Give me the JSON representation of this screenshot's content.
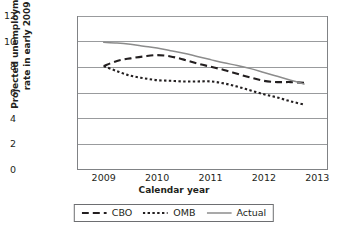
{
  "chart_data": {
    "type": "line",
    "title": "",
    "xlabel": "Calendar year",
    "ylabel": "Projected unemployment rate in early 2009",
    "ylabel_line1": "Projected unemployment",
    "ylabel_line2": "rate in early 2009",
    "xlim": [
      2008.5,
      2013.2
    ],
    "ylim": [
      0,
      12
    ],
    "yticks": [
      12,
      10,
      8,
      6,
      4,
      2,
      0
    ],
    "xticks": [
      2009,
      2010,
      2011,
      2012,
      2013
    ],
    "grid": "horizontal",
    "legend_position": "bottom-center",
    "series": [
      {
        "name": "CBO",
        "style": "dashed",
        "color": "#231f20",
        "x": [
          2009.0,
          2009.25,
          2009.5,
          2009.75,
          2010.0,
          2010.25,
          2010.5,
          2010.75,
          2011.0,
          2011.25,
          2011.5,
          2011.75,
          2012.0,
          2012.25,
          2012.5,
          2012.75
        ],
        "y": [
          8.1,
          8.5,
          8.7,
          8.85,
          8.95,
          8.85,
          8.6,
          8.3,
          8.05,
          7.8,
          7.5,
          7.2,
          6.95,
          6.85,
          6.85,
          6.8
        ]
      },
      {
        "name": "OMB",
        "style": "dotted",
        "color": "#231f20",
        "x": [
          2009.0,
          2009.25,
          2009.5,
          2009.75,
          2010.0,
          2010.25,
          2010.5,
          2010.75,
          2011.0,
          2011.25,
          2011.5,
          2011.75,
          2012.0,
          2012.25,
          2012.5,
          2012.75
        ],
        "y": [
          8.1,
          7.7,
          7.35,
          7.15,
          7.0,
          6.95,
          6.9,
          6.9,
          6.9,
          6.75,
          6.5,
          6.2,
          5.9,
          5.65,
          5.35,
          5.1
        ]
      },
      {
        "name": "Actual",
        "style": "solid",
        "color": "#8c8c8c",
        "x": [
          2009.0,
          2009.25,
          2009.5,
          2009.75,
          2010.0,
          2010.25,
          2010.5,
          2010.75,
          2011.0,
          2011.25,
          2011.5,
          2011.75,
          2012.0,
          2012.25,
          2012.5,
          2012.75
        ],
        "y": [
          9.95,
          9.9,
          9.8,
          9.65,
          9.5,
          9.3,
          9.1,
          8.85,
          8.6,
          8.35,
          8.15,
          7.9,
          7.6,
          7.3,
          7.0,
          6.7
        ]
      }
    ],
    "legend": [
      {
        "label": "CBO",
        "style": "dashed"
      },
      {
        "label": "OMB",
        "style": "dotted"
      },
      {
        "label": "Actual",
        "style": "solid"
      }
    ]
  }
}
